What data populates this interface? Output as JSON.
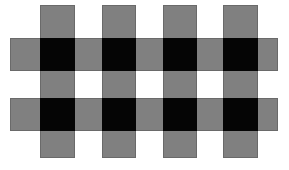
{
  "figure": {
    "type": "geometric-pattern",
    "canvas": {
      "width": 289,
      "height": 170,
      "background_color": "#ffffff"
    },
    "colors": {
      "stripe_gray": "#808080",
      "stripe_outline": "#6a6a6a",
      "intersection_black": "#050505",
      "background_white": "#ffffff"
    },
    "counts": {
      "horizontal_bands": 2,
      "vertical_columns": 4,
      "black_intersections": 8
    },
    "horizontal_bands": [
      {
        "label": "band-1",
        "x": 10,
        "y": 38,
        "width": 268,
        "height": 33
      },
      {
        "label": "band-2",
        "x": 10,
        "y": 98,
        "width": 268,
        "height": 33
      }
    ],
    "vertical_columns": [
      {
        "label": "column-1",
        "x": 40,
        "y": 5,
        "width": 35,
        "height": 153
      },
      {
        "label": "column-2",
        "x": 102,
        "y": 5,
        "width": 34,
        "height": 153
      },
      {
        "label": "column-3",
        "x": 163,
        "y": 5,
        "width": 34,
        "height": 153
      },
      {
        "label": "column-4",
        "x": 223,
        "y": 5,
        "width": 35,
        "height": 153
      }
    ],
    "intersections": [
      {
        "label": "cross-r1c1",
        "x": 40,
        "y": 38,
        "width": 35,
        "height": 33
      },
      {
        "label": "cross-r1c2",
        "x": 102,
        "y": 38,
        "width": 34,
        "height": 33
      },
      {
        "label": "cross-r1c3",
        "x": 163,
        "y": 38,
        "width": 34,
        "height": 33
      },
      {
        "label": "cross-r1c4",
        "x": 223,
        "y": 38,
        "width": 35,
        "height": 33
      },
      {
        "label": "cross-r2c1",
        "x": 40,
        "y": 98,
        "width": 35,
        "height": 33
      },
      {
        "label": "cross-r2c2",
        "x": 102,
        "y": 98,
        "width": 34,
        "height": 33
      },
      {
        "label": "cross-r2c3",
        "x": 163,
        "y": 98,
        "width": 34,
        "height": 33
      },
      {
        "label": "cross-r2c4",
        "x": 223,
        "y": 98,
        "width": 35,
        "height": 33
      }
    ]
  }
}
